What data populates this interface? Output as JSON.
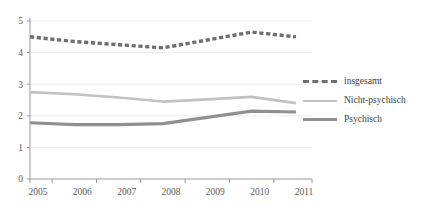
{
  "chart_data": {
    "type": "line",
    "title": "",
    "subtitle": "",
    "xlabel": "",
    "ylabel": "",
    "categories": [
      "2005",
      "2006",
      "2007",
      "2008",
      "2009",
      "2010",
      "2011"
    ],
    "x": [
      2005,
      2006,
      2007,
      2008,
      2009,
      2010,
      2011
    ],
    "ylim": [
      0,
      5
    ],
    "xlim": [
      2005,
      2011
    ],
    "yticks": [
      "0",
      "1",
      "2",
      "3",
      "4",
      "5"
    ],
    "ytick_values": [
      0,
      1,
      2,
      3,
      4,
      5
    ],
    "grid": "horizontal",
    "legend_position": "right",
    "series": [
      {
        "name": "insgesamt",
        "values": [
          4.5,
          4.35,
          4.25,
          4.15,
          4.4,
          4.65,
          4.5
        ],
        "style": "dashed",
        "color": "#6e6e6e",
        "width": 3.4
      },
      {
        "name": "Nicht-psychisch",
        "values": [
          2.75,
          2.68,
          2.58,
          2.45,
          2.52,
          2.6,
          2.4
        ],
        "style": "solid",
        "color": "#c2c2c2",
        "width": 2.6
      },
      {
        "name": "Psychisch",
        "values": [
          1.78,
          1.72,
          1.72,
          1.75,
          1.95,
          2.15,
          2.12
        ],
        "style": "solid",
        "color": "#909090",
        "width": 3.2
      }
    ]
  },
  "legend": {
    "items": [
      {
        "label": "insgesamt",
        "swatch": "dashed"
      },
      {
        "label": "Nicht-psychisch",
        "swatch": "light"
      },
      {
        "label": "Psychisch",
        "swatch": "medium"
      }
    ]
  },
  "axes": {
    "grid_color": "#ededed",
    "axis_color": "#9a9a9a",
    "tick_color": "#9a9a9a"
  }
}
